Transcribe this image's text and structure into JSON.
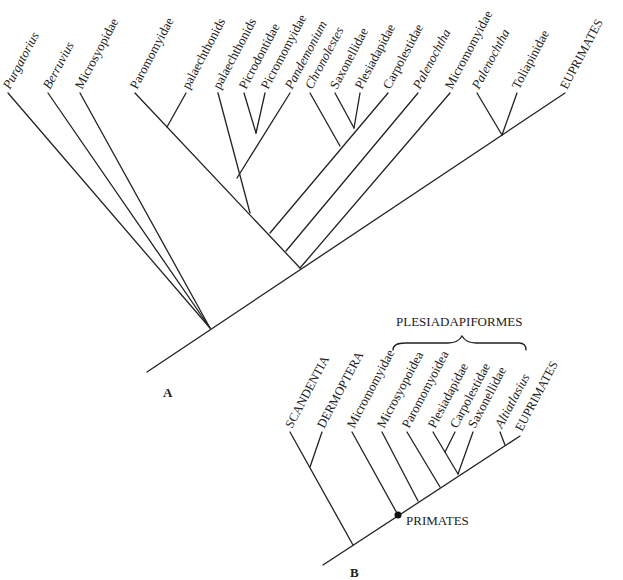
{
  "panel_a": {
    "label": "A",
    "taxa": [
      {
        "name": "Purgatorius",
        "italic": true
      },
      {
        "name": "Berruvius",
        "italic": true
      },
      {
        "name": "Microsyopidae",
        "italic": false
      },
      {
        "name": "Paromomyidae",
        "italic": false
      },
      {
        "name": "palaechthonids",
        "italic": false
      },
      {
        "name": "palaechthonids",
        "italic": false
      },
      {
        "name": "Picrodontidae",
        "italic": false
      },
      {
        "name": "Picromomyidae",
        "italic": false
      },
      {
        "name": "Pandemonium",
        "italic": true
      },
      {
        "name": "Chronolestes",
        "italic": true
      },
      {
        "name": "Saxonellidae",
        "italic": false
      },
      {
        "name": "Plesiadapidae",
        "italic": false
      },
      {
        "name": "Carpolestidae",
        "italic": false
      },
      {
        "name": "Palenochtha",
        "italic": true
      },
      {
        "name": "Micromomyidae",
        "italic": false
      },
      {
        "name": "Palenochtha",
        "italic": true
      },
      {
        "name": "Toliapinidae",
        "italic": false
      },
      {
        "name": "EUPRIMATES",
        "italic": false
      }
    ]
  },
  "panel_b": {
    "label": "B",
    "group_label": "PLESIADAPIFORMES",
    "node_label": "PRIMATES",
    "taxa": [
      {
        "name": "SCANDENTIA",
        "italic": false
      },
      {
        "name": "DERMOPTERA",
        "italic": false
      },
      {
        "name": "Micromomyidae",
        "italic": false
      },
      {
        "name": "Microsyopoidea",
        "italic": false
      },
      {
        "name": "Paromomyoidea",
        "italic": false
      },
      {
        "name": "Plesiadapidae",
        "italic": false
      },
      {
        "name": "Carpolestidae",
        "italic": false
      },
      {
        "name": "Saxonellidae",
        "italic": false
      },
      {
        "name": "Altiatlasius",
        "italic": true
      },
      {
        "name": "EUPRIMATES",
        "italic": false
      }
    ]
  }
}
